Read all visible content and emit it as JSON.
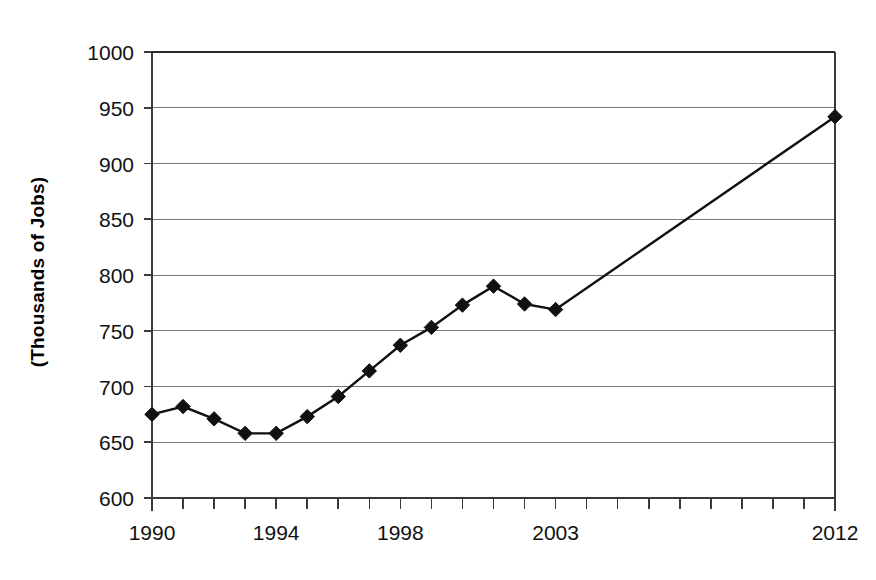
{
  "chart_data": {
    "type": "line",
    "title": "",
    "subtitle": "",
    "xlabel": "",
    "ylabel": "(Thousands of Jobs)",
    "ylim": [
      600,
      1000
    ],
    "ytick_step": 50,
    "yticks": [
      600,
      650,
      700,
      750,
      800,
      850,
      900,
      950,
      1000
    ],
    "ytick_labels": [
      "600",
      "650",
      "700",
      "750",
      "800",
      "850",
      "900",
      "950",
      "1000"
    ],
    "xlim": [
      1990,
      2012
    ],
    "xticks": [
      1990,
      1991,
      1992,
      1993,
      1994,
      1995,
      1996,
      1997,
      1998,
      1999,
      2000,
      2001,
      2002,
      2003,
      2004,
      2005,
      2006,
      2007,
      2008,
      2009,
      2010,
      2011,
      2012
    ],
    "xtick_labels_shown": [
      "1990",
      "1994",
      "1998",
      "2003",
      "2012"
    ],
    "xtick_labels_shown_values": [
      1990,
      1994,
      1998,
      2003,
      2012
    ],
    "grid": "horizontal",
    "legend": "none",
    "marker": "diamond",
    "line_color": "#111111",
    "marker_color": "#111111",
    "grid_color": "#7a7a7a",
    "background_color": "#ffffff",
    "x": [
      1990,
      1991,
      1992,
      1993,
      1994,
      1995,
      1996,
      1997,
      1998,
      1999,
      2000,
      2001,
      2002,
      2003,
      2012
    ],
    "values": [
      675,
      682,
      671,
      658,
      658,
      673,
      691,
      714,
      737,
      753,
      773,
      790,
      774,
      769,
      942
    ],
    "series": [
      {
        "name": "Jobs",
        "x": [
          1990,
          1991,
          1992,
          1993,
          1994,
          1995,
          1996,
          1997,
          1998,
          1999,
          2000,
          2001,
          2002,
          2003,
          2012
        ],
        "values": [
          675,
          682,
          671,
          658,
          658,
          673,
          691,
          714,
          737,
          753,
          773,
          790,
          774,
          769,
          942
        ]
      }
    ],
    "annotations": []
  }
}
